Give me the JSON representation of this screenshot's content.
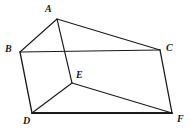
{
  "figure": {
    "type": "geometry-diagram",
    "shape_name": "triangular-prism",
    "background_color": "#ffffff",
    "stroke_color": "#1a1a1a",
    "width": 191,
    "height": 132,
    "vertices": [
      {
        "id": "A",
        "label": "A",
        "x": 57,
        "y": 19,
        "label_x": 45,
        "label_y": 4
      },
      {
        "id": "B",
        "label": "B",
        "x": 20,
        "y": 52,
        "label_x": 5,
        "label_y": 44
      },
      {
        "id": "C",
        "label": "C",
        "x": 160,
        "y": 50,
        "label_x": 166,
        "label_y": 43
      },
      {
        "id": "D",
        "label": "D",
        "x": 32,
        "y": 113,
        "label_x": 23,
        "label_y": 116
      },
      {
        "id": "E",
        "label": "E",
        "x": 72,
        "y": 83,
        "label_x": 76,
        "label_y": 70
      },
      {
        "id": "F",
        "label": "F",
        "x": 172,
        "y": 113,
        "label_x": 177,
        "label_y": 114
      }
    ],
    "edges": [
      {
        "id": "AB",
        "from": "A",
        "to": "B",
        "width": 1.1
      },
      {
        "id": "AC",
        "from": "A",
        "to": "C",
        "width": 1.1
      },
      {
        "id": "AE",
        "from": "A",
        "to": "E",
        "width": 1.1
      },
      {
        "id": "BC",
        "from": "B",
        "to": "C",
        "width": 1.1
      },
      {
        "id": "BD",
        "from": "B",
        "to": "D",
        "width": 1.3
      },
      {
        "id": "CF",
        "from": "C",
        "to": "F",
        "width": 1.3
      },
      {
        "id": "DE",
        "from": "D",
        "to": "E",
        "width": 1.1
      },
      {
        "id": "EF",
        "from": "E",
        "to": "F",
        "width": 1.1
      },
      {
        "id": "DF",
        "from": "D",
        "to": "F",
        "width": 1.8
      }
    ]
  }
}
